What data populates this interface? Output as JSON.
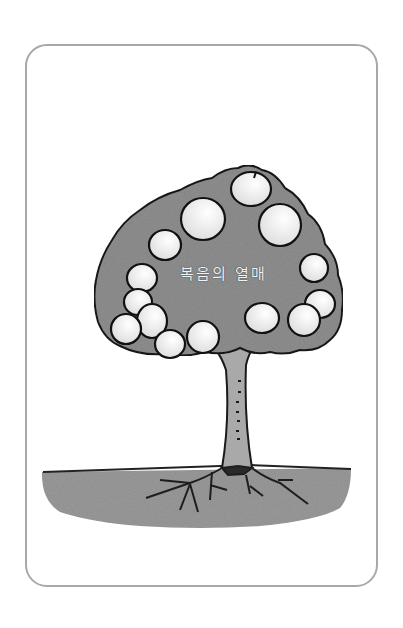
{
  "illustration": {
    "subject": "tree-with-fruits",
    "label": "복음의 열매",
    "colors": {
      "frame": "#a8a8a8",
      "canopy": "#8f8f8f",
      "fruit": "#e6e6e6",
      "trunk": "#a9a9a9",
      "ground": "#9a9a9a",
      "outline": "#1a1a1a"
    },
    "fruit_count": 13
  }
}
